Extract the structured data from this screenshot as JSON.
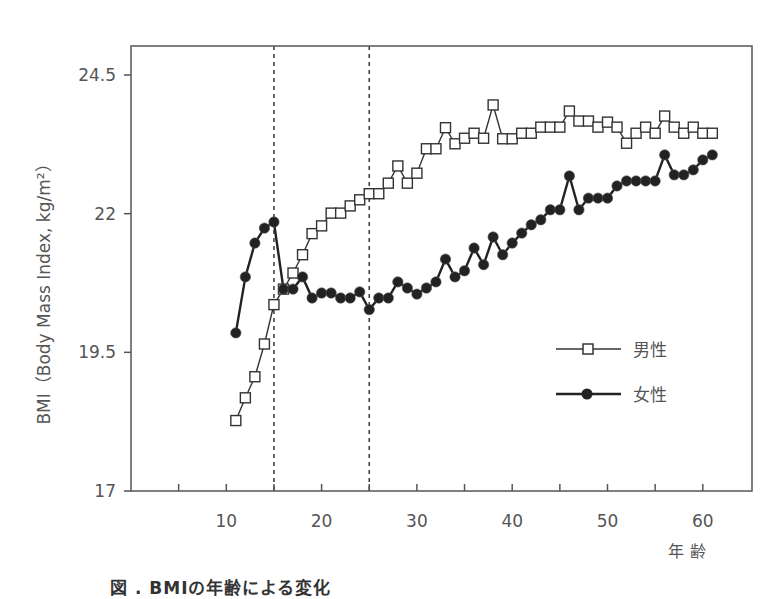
{
  "chart_data": {
    "type": "line",
    "title": "",
    "xlabel": "年 齢",
    "ylabel": "BMI（Body Mass Index, kg/m²）",
    "xlim": [
      0,
      65
    ],
    "ylim": [
      17,
      25.3
    ],
    "x_ticks": [
      5,
      10,
      15,
      20,
      25,
      30,
      35,
      40,
      45,
      50,
      55,
      60
    ],
    "x_tick_labels": [
      "10",
      "20",
      "30",
      "40",
      "50",
      "60"
    ],
    "x_tick_label_values": [
      10,
      20,
      30,
      40,
      50,
      60
    ],
    "y_ticks": [
      17,
      19.5,
      22,
      24.5
    ],
    "y_tick_labels": [
      "17",
      "19.5",
      "22",
      "24.5"
    ],
    "grid": false,
    "legend_position": "lower-right inside",
    "reference_lines": [
      {
        "orientation": "vertical",
        "x": 15,
        "style": "dashed"
      },
      {
        "orientation": "vertical",
        "x": 25,
        "style": "dashed"
      }
    ],
    "x": [
      11,
      12,
      13,
      14,
      15,
      16,
      17,
      18,
      19,
      20,
      21,
      22,
      23,
      24,
      25,
      26,
      27,
      28,
      29,
      30,
      31,
      32,
      33,
      34,
      35,
      36,
      37,
      38,
      39,
      40,
      41,
      42,
      43,
      44,
      45,
      46,
      47,
      48,
      49,
      50,
      51,
      52,
      53,
      54,
      55,
      56,
      57,
      58,
      59,
      60,
      61
    ],
    "series": [
      {
        "name": "男性",
        "marker": "open-square",
        "values": [
          18.27,
          18.68,
          19.06,
          19.65,
          20.36,
          20.64,
          20.93,
          21.26,
          21.64,
          21.78,
          22.01,
          22.01,
          22.14,
          22.25,
          22.36,
          22.36,
          22.55,
          22.86,
          22.55,
          22.73,
          23.17,
          23.17,
          23.55,
          23.26,
          23.36,
          23.45,
          23.36,
          23.96,
          23.35,
          23.35,
          23.45,
          23.45,
          23.56,
          23.56,
          23.56,
          23.85,
          23.67,
          23.67,
          23.56,
          23.65,
          23.56,
          23.27,
          23.45,
          23.56,
          23.45,
          23.76,
          23.56,
          23.45,
          23.56,
          23.45,
          23.45
        ]
      },
      {
        "name": "女性",
        "marker": "filled-circle",
        "values": [
          19.85,
          20.86,
          21.47,
          21.74,
          21.85,
          20.64,
          20.64,
          20.86,
          20.48,
          20.57,
          20.57,
          20.48,
          20.48,
          20.59,
          20.27,
          20.48,
          20.48,
          20.77,
          20.66,
          20.55,
          20.66,
          20.77,
          21.18,
          20.86,
          20.97,
          21.38,
          21.08,
          21.58,
          21.26,
          21.47,
          21.65,
          21.8,
          21.89,
          22.07,
          22.07,
          22.68,
          22.07,
          22.28,
          22.28,
          22.28,
          22.5,
          22.59,
          22.59,
          22.59,
          22.59,
          23.06,
          22.7,
          22.7,
          22.79,
          22.97,
          23.06
        ]
      }
    ]
  },
  "legend": {
    "items": [
      {
        "label": "男性",
        "marker": "open-square"
      },
      {
        "label": "女性",
        "marker": "filled-circle"
      }
    ]
  },
  "axes": {
    "x_title": "年 齢",
    "y_title": "BMI（Body Mass Index, kg/m²）"
  },
  "caption": "図 . BMIの年齢による変化"
}
